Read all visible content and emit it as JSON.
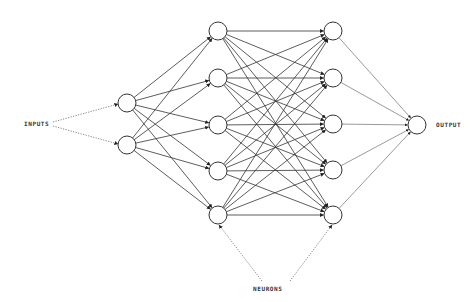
{
  "diagram": {
    "type": "neural-network",
    "labels": {
      "inputs": "INPUTS",
      "neurons": "NEURONS",
      "output": "OUTPUT"
    },
    "colors": {
      "stroke": "#333333",
      "node_fill": "#ffffff",
      "background": "#ffffff"
    },
    "node_radius": 9,
    "layers": [
      {
        "name": "input",
        "x": 127,
        "ys": [
          103,
          145
        ]
      },
      {
        "name": "hidden-1",
        "x": 218,
        "ys": [
          31,
          78,
          125,
          171,
          215
        ]
      },
      {
        "name": "hidden-2",
        "x": 333,
        "ys": [
          31,
          78,
          124,
          170,
          215
        ]
      },
      {
        "name": "output",
        "x": 417,
        "ys": [
          125
        ]
      }
    ],
    "label_positions": {
      "inputs": {
        "x": 24,
        "y": 126
      },
      "neurons": {
        "x": 253,
        "y": 291
      },
      "output": {
        "x": 436,
        "y": 127
      }
    },
    "annotation_arrows": [
      {
        "from": [
          53,
          122
        ],
        "to": [
          118,
          104
        ],
        "style": "dotted"
      },
      {
        "from": [
          53,
          126
        ],
        "to": [
          118,
          144
        ],
        "style": "dotted"
      },
      {
        "from": [
          262,
          281
        ],
        "to": [
          219,
          225
        ],
        "style": "dotted"
      },
      {
        "from": [
          290,
          281
        ],
        "to": [
          332,
          225
        ],
        "style": "dotted"
      }
    ]
  }
}
